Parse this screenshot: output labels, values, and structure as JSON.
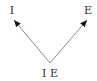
{
  "diagram": {
    "nodes": [
      {
        "id": "top-left",
        "label": "I"
      },
      {
        "id": "top-right",
        "label": "E"
      },
      {
        "id": "bottom",
        "label": "I E"
      }
    ],
    "edges": [
      {
        "from": "bottom",
        "to": "top-left",
        "style": "arrow"
      },
      {
        "from": "bottom",
        "to": "top-right",
        "style": "arrow"
      }
    ],
    "colors": {
      "line": "#8a8a8a",
      "arrowhead": "#1a1a1a",
      "text": "#333333"
    }
  }
}
